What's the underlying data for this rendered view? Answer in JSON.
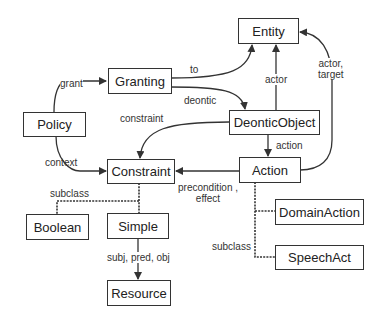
{
  "diagram": {
    "nodes": {
      "entity": "Entity",
      "granting": "Granting",
      "policy": "Policy",
      "deontic_object": "DeonticObject",
      "constraint": "Constraint",
      "action": "Action",
      "boolean": "Boolean",
      "simple": "Simple",
      "resource": "Resource",
      "domain_action": "DomainAction",
      "speech_act": "SpeechAct"
    },
    "edges": {
      "grant": "grant",
      "to": "to",
      "deontic": "deontic",
      "constraint": "constraint",
      "context": "context",
      "actor": "actor",
      "actor_target_1": "actor,",
      "actor_target_2": "target",
      "action": "action",
      "precondition_1": "precondition ,",
      "precondition_2": "effect",
      "subclass_left": "subclass",
      "subclass_right": "subclass",
      "subj_pred_obj": "subj, pred, obj"
    }
  }
}
